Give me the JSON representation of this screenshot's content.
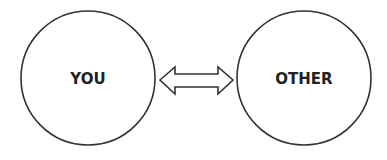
{
  "diagram": {
    "nodes": [
      {
        "id": "you",
        "label": "YOU"
      },
      {
        "id": "other",
        "label": "OTHER"
      }
    ],
    "edges": [
      {
        "from": "you",
        "to": "other",
        "type": "bidirectional-arrow"
      }
    ],
    "colors": {
      "stroke": "#333333",
      "text": "#222222",
      "background": "#ffffff"
    }
  }
}
